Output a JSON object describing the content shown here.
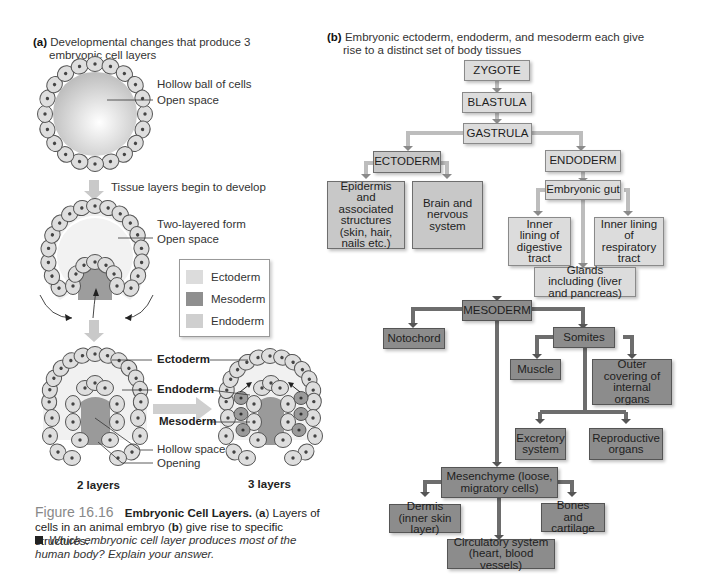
{
  "panel_a": {
    "header_letter": "(a)",
    "header_text_line1": "Developmental changes that produce 3",
    "header_text_line2": "embryonic cell layers",
    "stage1": {
      "title": "Hollow ball of cells",
      "label_open_space": "Open space"
    },
    "arrow1_label": "Tissue layers begin to develop",
    "stage2": {
      "title": "Two-layered form",
      "label_open_space": "Open space"
    },
    "legend": [
      {
        "label": "Ectoderm",
        "color": "#dcdcdc"
      },
      {
        "label": "Mesoderm",
        "color": "#8f8f8f"
      },
      {
        "label": "Endoderm",
        "color": "#cfcfcf"
      }
    ],
    "stage3": {
      "label_ectoderm": "Ectoderm",
      "label_endoderm": "Endoderm",
      "label_mesoderm": "Mesoderm",
      "label_hollow": "Hollow space",
      "label_opening": "Opening",
      "caption_left": "2 layers",
      "caption_right": "3 layers"
    }
  },
  "panel_b": {
    "header_letter": "(b)",
    "header_text_line1": "Embryonic ectoderm, endoderm, and mesoderm each give",
    "header_text_line2": "rise to a distinct set of body tissues",
    "nodes": {
      "zygote": "ZYGOTE",
      "blastula": "BLASTULA",
      "gastrula": "GASTRULA",
      "ectoderm": "ECTODERM",
      "endoderm": "ENDODERM",
      "epidermis": "Epidermis and associated structures (skin, hair, nails etc.)",
      "brain": "Brain and nervous system",
      "gut": "Embryonic gut",
      "digestive": "Inner lining of digestive tract",
      "respiratory": "Inner lining of respiratory tract",
      "glands": "Glands including (liver and pancreas)",
      "mesoderm": "MESODERM",
      "notochord": "Notochord",
      "somites": "Somites",
      "muscle": "Muscle",
      "outer_covering": "Outer covering of internal organs",
      "excretory": "Excretory system",
      "reproductive": "Reproductive organs",
      "mesenchyme": "Mesenchyme (loose, migratory cells)",
      "dermis": "Dermis (inner skin layer)",
      "bones": "Bones and cartilage",
      "circulatory": "Circulatory system (heart, blood vessels)"
    }
  },
  "caption": {
    "figure_number": "Figure 16.16",
    "title": "Embryonic Cell Layers.",
    "text_a_open": "(",
    "a": "a",
    "text_a_rest": ") Layers of cells in an animal embryo (",
    "b": "b",
    "text_b_rest": ") give rise to specific structures."
  },
  "question": "Which embryonic cell layer produces most of the human body? Explain your answer."
}
